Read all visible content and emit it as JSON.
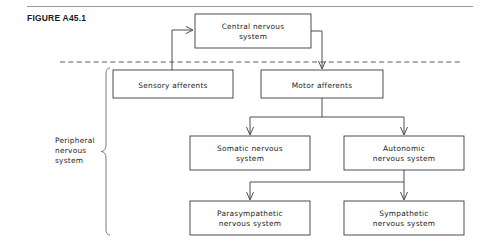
{
  "figure": {
    "label": "FIGURE A45.1",
    "divider_style": "dashed",
    "stroke_color": "#3b3b3b",
    "background_color": "#ffffff"
  },
  "side_label": {
    "name": "peripheral-nervous-system-label",
    "lines": [
      "Peripheral",
      "nervous",
      "system"
    ]
  },
  "nodes": [
    {
      "id": "central-nervous-system",
      "lines": [
        "Central nervous",
        "system"
      ],
      "x": 195,
      "y": 14,
      "w": 116,
      "h": 34
    },
    {
      "id": "sensory-afferents",
      "lines": [
        "Sensory afferents"
      ],
      "x": 113,
      "y": 70,
      "w": 120,
      "h": 28
    },
    {
      "id": "motor-afferents",
      "lines": [
        "Motor afferents"
      ],
      "x": 261,
      "y": 70,
      "w": 122,
      "h": 28
    },
    {
      "id": "somatic-nervous-system",
      "lines": [
        "Somatic nervous",
        "system"
      ],
      "x": 190,
      "y": 136,
      "w": 120,
      "h": 34
    },
    {
      "id": "autonomic-nervous-system",
      "lines": [
        "Autonomic",
        "nervous system"
      ],
      "x": 344,
      "y": 136,
      "w": 120,
      "h": 34
    },
    {
      "id": "parasympathetic-nervous-system",
      "lines": [
        "Parasympathetic",
        "nervous system"
      ],
      "x": 190,
      "y": 201,
      "w": 120,
      "h": 34
    },
    {
      "id": "sympathetic-nervous-system",
      "lines": [
        "Sympathetic",
        "nervous system"
      ],
      "x": 344,
      "y": 201,
      "w": 120,
      "h": 34
    }
  ],
  "connections": [
    {
      "id": "sensory-to-cns",
      "from": "sensory-afferents",
      "to": "central-nervous-system",
      "arrow": true
    },
    {
      "id": "cns-to-motor",
      "from": "central-nervous-system",
      "to": "motor-afferents",
      "arrow": true
    },
    {
      "id": "motor-to-somatic",
      "from": "motor-afferents",
      "to": "somatic-nervous-system",
      "arrow": true
    },
    {
      "id": "motor-to-autonomic",
      "from": "motor-afferents",
      "to": "autonomic-nervous-system",
      "arrow": true
    },
    {
      "id": "autonomic-to-parasympathetic",
      "from": "autonomic-nervous-system",
      "to": "parasympathetic-nervous-system",
      "arrow": true
    },
    {
      "id": "autonomic-to-sympathetic",
      "from": "autonomic-nervous-system",
      "to": "sympathetic-nervous-system",
      "arrow": true
    }
  ]
}
